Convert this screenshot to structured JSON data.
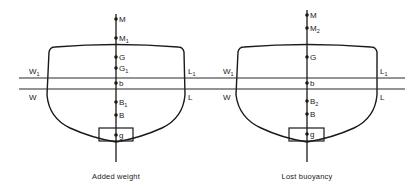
{
  "figure": {
    "panels": [
      {
        "id": "added-weight",
        "caption": "Added weight",
        "waterlines": {
          "upper": {
            "left": "W",
            "left_sub": "1",
            "right": "L",
            "right_sub": "1"
          },
          "lower": {
            "left": "W",
            "right": "L"
          }
        },
        "points": [
          {
            "label": "M",
            "sub": ""
          },
          {
            "label": "M",
            "sub": "1"
          },
          {
            "label": "G",
            "sub": ""
          },
          {
            "label": "G",
            "sub": "1"
          },
          {
            "label": "b",
            "sub": ""
          },
          {
            "label": "B",
            "sub": "1"
          },
          {
            "label": "B",
            "sub": ""
          },
          {
            "label": "g",
            "sub": ""
          }
        ]
      },
      {
        "id": "lost-buoyancy",
        "caption": "Lost buoyancy",
        "waterlines": {
          "upper": {
            "left": "W",
            "left_sub": "1",
            "right": "L",
            "right_sub": "1"
          },
          "lower": {
            "left": "W",
            "right": "L"
          }
        },
        "points": [
          {
            "label": "M",
            "sub": ""
          },
          {
            "label": "M",
            "sub": "2"
          },
          {
            "label": "G",
            "sub": ""
          },
          {
            "label": "b",
            "sub": ""
          },
          {
            "label": "B",
            "sub": "2"
          },
          {
            "label": "B",
            "sub": ""
          },
          {
            "label": "g",
            "sub": ""
          }
        ]
      }
    ]
  }
}
